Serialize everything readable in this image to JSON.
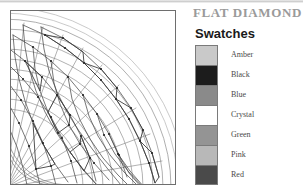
{
  "sheet": {
    "title": "FLAT DIAMOND",
    "title_color": "#9a9a9a"
  },
  "legend": {
    "heading": "Swatches",
    "heading_color": "#1a1a1a",
    "swatches": [
      {
        "label": "Amber",
        "color": "#c9c9c9"
      },
      {
        "label": "Black",
        "color": "#1c1c1c"
      },
      {
        "label": "Blue",
        "color": "#8a8a8a"
      },
      {
        "label": "Crystal",
        "color": "#ffffff"
      },
      {
        "label": "Green",
        "color": "#949494"
      },
      {
        "label": "Pink",
        "color": "#b8b8b8"
      },
      {
        "label": "Red",
        "color": "#4a4a4a"
      }
    ]
  },
  "figure": {
    "name": "flat-diamond-quarter-dome-plan",
    "line_color": "#6b6b6b",
    "light_line_color": "#b0b0b0",
    "border_color": "#6e6e6e",
    "node_color": "#2a2a2a",
    "rings": 12,
    "radials": 12,
    "arc_radii": [
      150,
      156,
      162,
      55,
      48,
      41
    ],
    "origin_x": 0,
    "origin_y": 173
  }
}
